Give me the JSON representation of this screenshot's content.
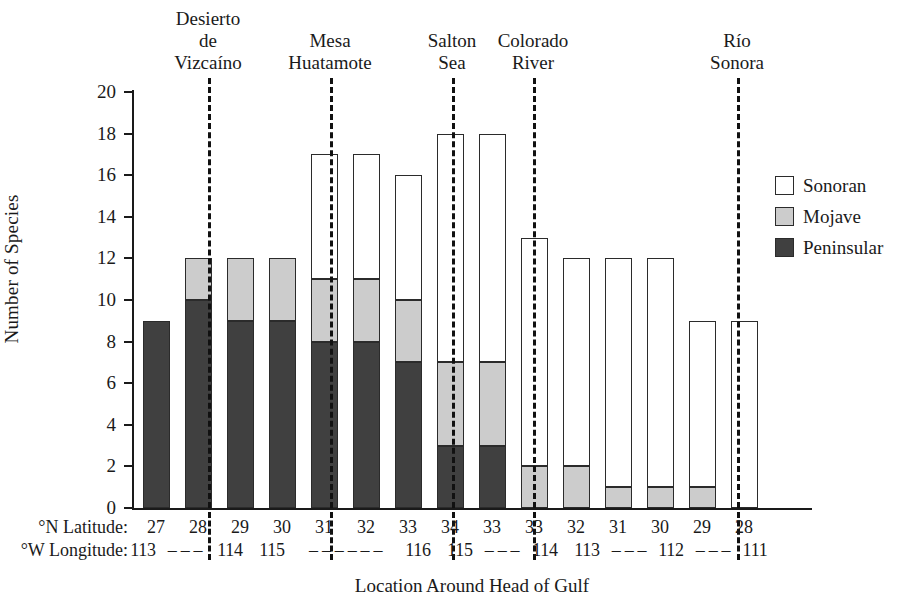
{
  "chart_data": {
    "type": "bar",
    "title": "",
    "subtitle": "",
    "xlabel": "Location Around Head of Gulf",
    "ylabel": "Number of Species",
    "ylim": [
      0,
      20
    ],
    "yticks": [
      0,
      2,
      4,
      6,
      8,
      10,
      12,
      14,
      16,
      18,
      20
    ],
    "grid": false,
    "stacked": true,
    "legend_position": "right",
    "legend": [
      "Sonoran",
      "Mojave",
      "Peninsular"
    ],
    "colors": {
      "sonoran": "#ffffff",
      "mojave": "#cccccc",
      "peninsular": "#404040",
      "outline": "#2b2b2b"
    },
    "row_labels": {
      "latitude": "°N Latitude:",
      "longitude": "°W Longitude:"
    },
    "categories": [
      "27",
      "28",
      "29",
      "30",
      "31",
      "32",
      "33",
      "34",
      "33",
      "33",
      "32",
      "31",
      "30",
      "29",
      "28"
    ],
    "longitude_labels": [
      "113",
      "---",
      "114",
      "115",
      "-",
      "-",
      "-----",
      "116",
      "115",
      "---",
      "114",
      "113",
      "---",
      "112",
      "---",
      "111"
    ],
    "longitude_row": [
      {
        "text": "113",
        "x": 143
      },
      {
        "text": "– – –",
        "x": 185
      },
      {
        "text": "114",
        "x": 230
      },
      {
        "text": "115",
        "x": 272
      },
      {
        "text": "– – – – – –",
        "x": 345
      },
      {
        "text": "116",
        "x": 418
      },
      {
        "text": "115",
        "x": 460
      },
      {
        "text": "– – –",
        "x": 502
      },
      {
        "text": "114",
        "x": 545
      },
      {
        "text": "113",
        "x": 587
      },
      {
        "text": "– – –",
        "x": 629
      },
      {
        "text": "112",
        "x": 671
      },
      {
        "text": "– – –",
        "x": 713
      },
      {
        "text": "111",
        "x": 755
      }
    ],
    "series": [
      {
        "name": "Peninsular",
        "values": [
          9,
          10,
          9,
          9,
          8,
          8,
          7,
          3,
          3,
          0,
          0,
          0,
          0,
          0,
          0
        ]
      },
      {
        "name": "Mojave",
        "values": [
          0,
          2,
          3,
          3,
          3,
          3,
          3,
          4,
          4,
          2,
          2,
          1,
          1,
          1,
          0
        ]
      },
      {
        "name": "Sonoran",
        "values": [
          0,
          0,
          0,
          0,
          6,
          6,
          6,
          11,
          11,
          11,
          10,
          11,
          11,
          8,
          9
        ]
      }
    ],
    "totals": [
      9,
      12,
      12,
      12,
      17,
      17,
      16,
      18,
      18,
      13,
      12,
      12,
      12,
      9,
      9
    ],
    "regions": [
      {
        "label": "Desierto\nde\nVizcaíno",
        "center_x": 208,
        "divider_x": 208
      },
      {
        "label": "Mesa\nHuatamote",
        "center_x": 330,
        "divider_x": 330
      },
      {
        "label": "Salton\nSea",
        "center_x": 452,
        "divider_x": 452
      },
      {
        "label": "Colorado\nRiver",
        "center_x": 533,
        "divider_x": 533
      },
      {
        "label": "Río\nSonora",
        "center_x": 737,
        "divider_x": 737
      }
    ]
  }
}
